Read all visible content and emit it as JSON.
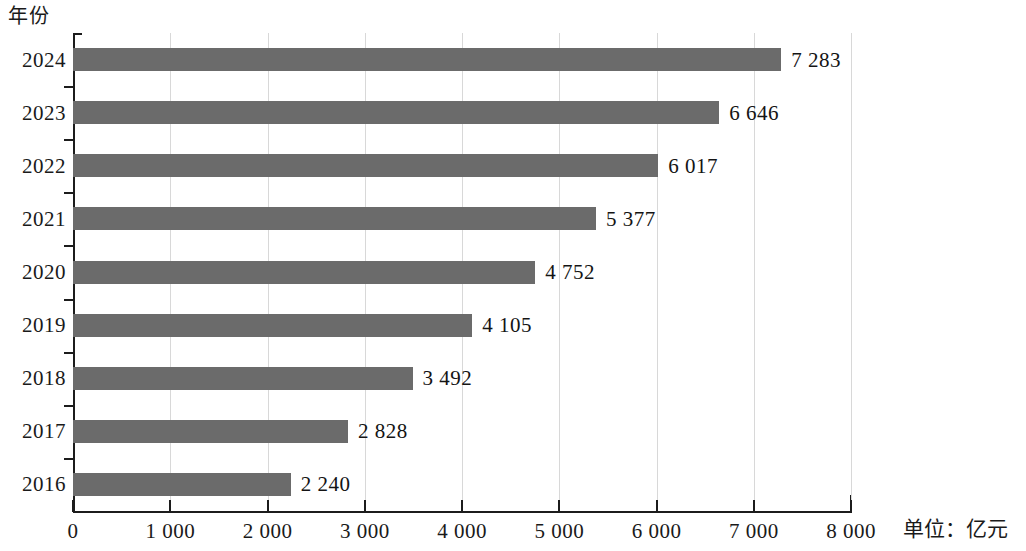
{
  "chart_data": {
    "type": "bar",
    "orientation": "horizontal",
    "title": "",
    "subtitle": "",
    "xlabel": "",
    "ylabel": "年份",
    "unit_note": "单位：亿元",
    "categories": [
      "2024",
      "2023",
      "2022",
      "2021",
      "2020",
      "2019",
      "2018",
      "2017",
      "2016"
    ],
    "values": [
      7283,
      6646,
      6017,
      5377,
      4752,
      4105,
      3492,
      2828,
      2240
    ],
    "value_labels": [
      "7 283",
      "6 646",
      "6 017",
      "5 377",
      "4 752",
      "4 105",
      "3 492",
      "2 828",
      "2 240"
    ],
    "xlim": [
      0,
      8000
    ],
    "x_ticks": [
      0,
      1000,
      2000,
      3000,
      4000,
      5000,
      6000,
      7000,
      8000
    ],
    "x_tick_labels": [
      "0",
      "1 000",
      "2 000",
      "3 000",
      "4 000",
      "5 000",
      "6 000",
      "7 000",
      "8 000"
    ],
    "grid": true,
    "grid_axis": "x",
    "legend": false,
    "bar_color": "#6b6b6b",
    "axis_color": "#1c1c1c",
    "grid_color": "#d8d8d8",
    "background_color": "#ffffff"
  }
}
